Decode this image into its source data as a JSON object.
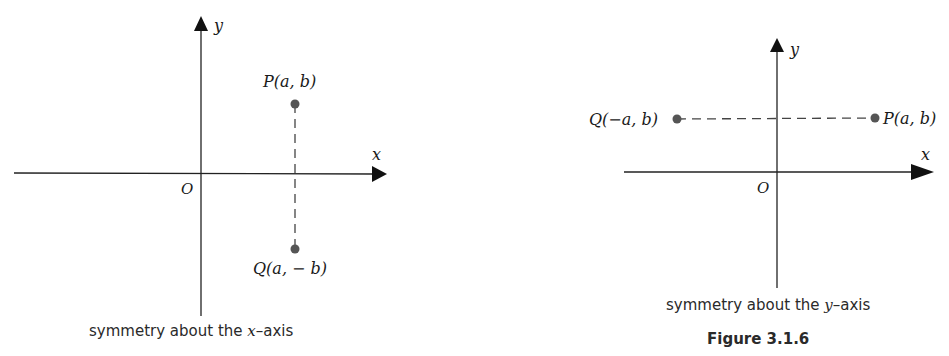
{
  "left_figure": {
    "axis_x_label": "x",
    "axis_y_label": "y",
    "origin_label": "O",
    "point_p_label": "P(a, b)",
    "point_q_label": "Q(a, − b)",
    "caption": "symmetry about the x-axis",
    "caption_parts": {
      "pre": "symmetry about the ",
      "var": "x",
      "post": "–axis"
    }
  },
  "right_figure": {
    "axis_x_label": "x",
    "axis_y_label": "y",
    "origin_label": "O",
    "point_p_label": "P(a, b)",
    "point_q_label": "Q(−a, b)",
    "caption": "symmetry about the y-axis",
    "caption_parts": {
      "pre": "symmetry about the ",
      "var": "y",
      "post": "–axis"
    },
    "figure_label": "Figure 3.1.6"
  },
  "colors": {
    "line": "#222222",
    "point": "#555555",
    "dash": "#444444"
  }
}
